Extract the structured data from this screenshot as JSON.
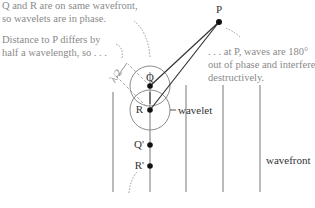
{
  "annotations": {
    "top_note_line1": "Q and R are on same wavefront,",
    "top_note_line2": "so wavelets are in phase.",
    "mid_note_line1": "Distance to P differs by",
    "mid_note_line2": "half a wavelength, so . . .",
    "right_note_line1": ". . . at P, waves are 180°",
    "right_note_line2": "out of phase and interfere",
    "right_note_line3": "destructively."
  },
  "labels": {
    "P": "P",
    "Q": "Q",
    "R": "R",
    "Q_prime": "Q'",
    "R_prime": "R'",
    "half_wavelength": "λ/2",
    "wavelet": "wavelet",
    "wavefront": "wavefront"
  },
  "colors": {
    "line": "#8c8c8c",
    "ray": "#333333",
    "dot": "#111111",
    "note": "#8a8a8a"
  }
}
